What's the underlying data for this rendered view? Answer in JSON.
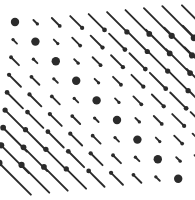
{
  "figure": {
    "background_color": "#ffffff",
    "glyph_color": "#2b2b2b",
    "width": 195,
    "height": 200
  },
  "chart_data": {
    "type": "scatter",
    "subtype": "vector-glyph-field",
    "title": "",
    "subtitle": "",
    "xlabel": "",
    "ylabel": "",
    "grid": false,
    "legend": false,
    "axes_visible": false,
    "tick_labels_x": [],
    "tick_labels_y": [],
    "annotations": [],
    "grid_layout": {
      "columns": 10,
      "rows": 9,
      "x_origin": 15,
      "y_origin": 22,
      "x_spacing": 20.4,
      "y_spacing": 19.6
    },
    "glyph_style": {
      "angle_degrees": 45,
      "direction": "down-right",
      "length_per_unit": 5.6,
      "max_length": 47,
      "line_width": 1.9,
      "head_shape": "round-blob",
      "head_radius_min": 1.4,
      "head_radius_max": 3.6,
      "zero_glyph_radius": 4.2,
      "head_points_away_from_zero_diagonal": true
    },
    "value_rule": "magnitude = |row_index - column_index|",
    "series": [
      {
        "name": "magnitude",
        "row_labels": [
          "r1",
          "r2",
          "r3",
          "r4",
          "r5",
          "r6",
          "r7",
          "r8",
          "r9"
        ],
        "column_labels": [
          "c1",
          "c2",
          "c3",
          "c4",
          "c5",
          "c6",
          "c7",
          "c8",
          "c9",
          "c10"
        ],
        "values": [
          [
            0,
            1,
            2,
            3,
            4,
            5,
            6,
            7,
            8,
            9
          ],
          [
            1,
            0,
            1,
            2,
            3,
            4,
            5,
            6,
            7,
            8
          ],
          [
            2,
            1,
            0,
            1,
            2,
            3,
            4,
            5,
            6,
            7
          ],
          [
            3,
            2,
            1,
            0,
            1,
            2,
            3,
            4,
            5,
            6
          ],
          [
            4,
            3,
            2,
            1,
            0,
            1,
            2,
            3,
            4,
            5
          ],
          [
            5,
            4,
            3,
            2,
            1,
            0,
            1,
            2,
            3,
            4
          ],
          [
            6,
            5,
            4,
            3,
            2,
            1,
            0,
            1,
            2,
            3
          ],
          [
            7,
            6,
            5,
            4,
            3,
            2,
            1,
            0,
            1,
            2
          ],
          [
            8,
            7,
            6,
            5,
            4,
            3,
            2,
            1,
            0,
            1
          ]
        ],
        "signs": [
          [
            0,
            1,
            1,
            1,
            1,
            1,
            1,
            1,
            1,
            1
          ],
          [
            -1,
            0,
            1,
            1,
            1,
            1,
            1,
            1,
            1,
            1
          ],
          [
            -1,
            -1,
            0,
            1,
            1,
            1,
            1,
            1,
            1,
            1
          ],
          [
            -1,
            -1,
            -1,
            0,
            1,
            1,
            1,
            1,
            1,
            1
          ],
          [
            -1,
            -1,
            -1,
            -1,
            0,
            1,
            1,
            1,
            1,
            1
          ],
          [
            -1,
            -1,
            -1,
            -1,
            -1,
            0,
            1,
            1,
            1,
            1
          ],
          [
            -1,
            -1,
            -1,
            -1,
            -1,
            -1,
            0,
            1,
            1,
            1
          ],
          [
            -1,
            -1,
            -1,
            -1,
            -1,
            -1,
            -1,
            0,
            1,
            1
          ],
          [
            -1,
            -1,
            -1,
            -1,
            -1,
            -1,
            -1,
            -1,
            0,
            1
          ]
        ]
      }
    ]
  }
}
